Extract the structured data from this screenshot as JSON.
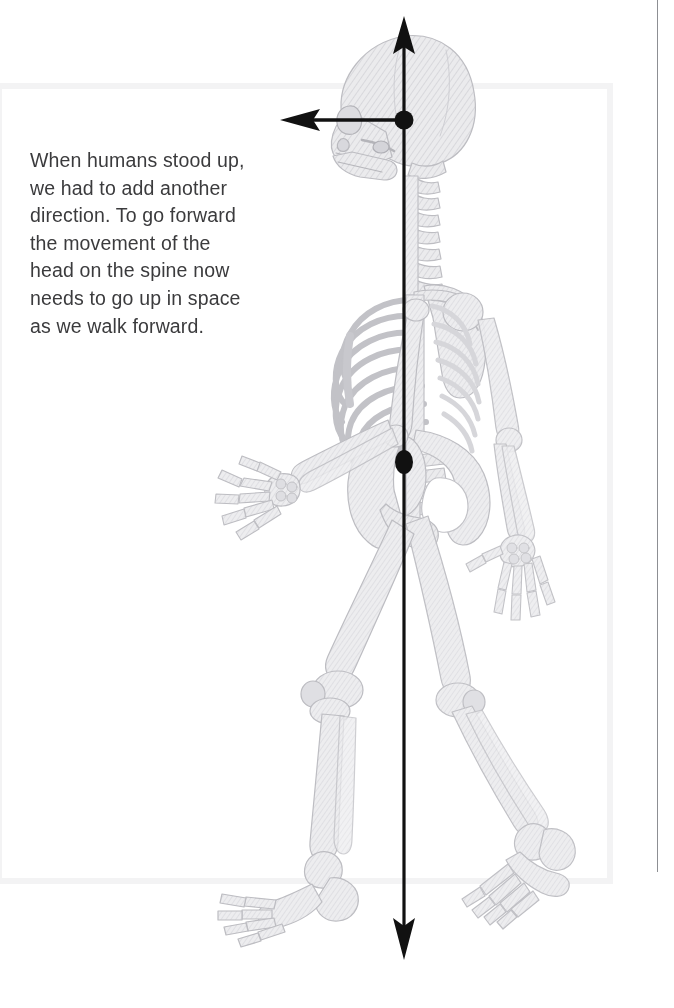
{
  "page": {
    "width": 674,
    "height": 1008,
    "background": "#ffffff"
  },
  "caption": {
    "text": "When humans stood up, we had to add another direction. To go forward the movement of the head on the spine now needs to go up in space as we walk forward.",
    "color": "#3b3b3d",
    "font_size_px": 19.5
  },
  "figure": {
    "bone_fill": "#e8e8ea",
    "bone_stroke": "#b9b9bd",
    "hatch_color": "#d2d2d6"
  },
  "annotations": {
    "axis_color": "#111111",
    "vertical_axis": {
      "name": "vertical-axis-arrow",
      "label": "up-down axis through head and spine",
      "top_x": 404,
      "top_y": 22,
      "bottom_x": 404,
      "bottom_y": 957,
      "arrowheads": [
        "up",
        "down"
      ]
    },
    "horizontal_axis": {
      "name": "horizontal-axis-arrow",
      "label": "forward direction arrow",
      "from_x": 404,
      "from_y": 120,
      "to_x": 281,
      "to_y": 120,
      "arrowheads": [
        "left"
      ]
    },
    "nodes": [
      {
        "name": "head-spine-joint-dot",
        "cx": 404,
        "cy": 120,
        "r": 9
      },
      {
        "name": "hip-joint-dot",
        "cx": 404,
        "cy": 462,
        "rx": 9,
        "ry": 12
      }
    ]
  },
  "decor": {
    "content_box": {
      "name": "content-frame",
      "color": "#f3f3f4",
      "left": -4,
      "top": 83,
      "width": 617,
      "height": 801
    },
    "right_rule": {
      "name": "right-margin-rule",
      "color": "#8d8f93",
      "x": 657,
      "top": 0,
      "height": 872
    }
  }
}
